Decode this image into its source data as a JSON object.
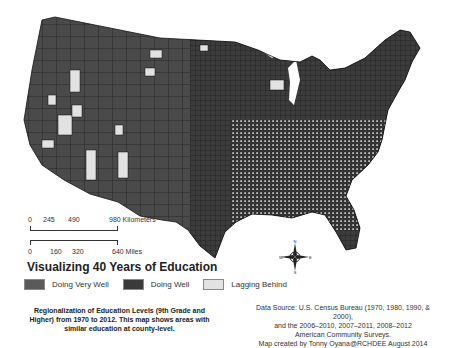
{
  "title": "Visualizing 40 Years of Education",
  "scale_bar": {
    "km_labels": [
      "0",
      "245",
      "490",
      "980 Kilometers"
    ],
    "mile_labels": [
      "0",
      "160",
      "320",
      "640 Miles"
    ]
  },
  "legend": {
    "items": [
      {
        "label": "Doing Very Well",
        "color": "#5a5a5a"
      },
      {
        "label": "Doing Well",
        "color": "#3a3a3a"
      },
      {
        "label": "Lagging Behind",
        "color": "#e2e2e2"
      }
    ]
  },
  "caption": "Regionalization of Education Levels (9th Grade and Higher) from 1970 to 2012. This map shows areas with similar education at county-level.",
  "source": {
    "line1": "Data Source: U.S. Census Bureau (1970, 1980, 1990, & 2000),",
    "line2": "and the 2006–2010,  2007–2011, 2008–2012",
    "line3": "American Community Surveys.",
    "line4": "Map created by Tonny Oyana@RCHDEE August 2014"
  },
  "compass": {
    "n": "N",
    "s": "S",
    "e": "E",
    "w": "W"
  },
  "colors": {
    "doing_very_well": "#5a5a5a",
    "doing_well": "#3a3a3a",
    "lagging_behind": "#e2e2e2",
    "border": "#111111"
  }
}
